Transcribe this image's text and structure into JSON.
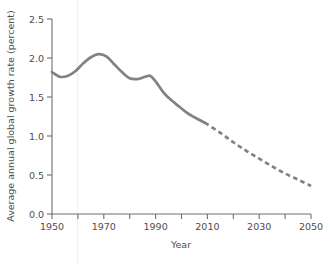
{
  "figure": {
    "width": 330,
    "height": 264,
    "background": "#ffffff",
    "line_color": "#828282",
    "axis_color": "#6e6e6e",
    "text_color": "#4d4d4d"
  },
  "axes": {
    "x_title": "Year",
    "y_title": "Average annual global growth rate (percent)",
    "x_tick_labels": [
      "1950",
      "1970",
      "1990",
      "2010",
      "2030",
      "2050"
    ],
    "x_labeled_ticks": [
      1950,
      1970,
      1990,
      2010,
      2030,
      2050
    ],
    "x_all_ticks": [
      1950,
      1960,
      1970,
      1980,
      1990,
      2000,
      2010,
      2020,
      2030,
      2040,
      2050
    ],
    "y_tick_labels": [
      "0.0",
      "0.5",
      "1.0",
      "1.5",
      "2.0",
      "2.5"
    ],
    "y_ticks": [
      0.0,
      0.5,
      1.0,
      1.5,
      2.0,
      2.5
    ]
  },
  "chart_data": {
    "type": "line",
    "title": "",
    "subtitle": "",
    "xlabel": "Year",
    "ylabel": "Average annual global growth rate (percent)",
    "xlim": [
      1950,
      2050
    ],
    "ylim": [
      0.0,
      2.5
    ],
    "grid": false,
    "legend": "none",
    "annotations": [
      "Solid line: historical estimates (1950-2009)",
      "Dashed line: projection (2009-2050)"
    ],
    "series": [
      {
        "name": "Average annual global growth rate (historical)",
        "style": "solid",
        "color": "#828282",
        "x": [
          1950,
          1953,
          1956,
          1959,
          1962,
          1965,
          1968,
          1971,
          1974,
          1977,
          1980,
          1983,
          1986,
          1988,
          1990,
          1993,
          1996,
          1999,
          2002,
          2005,
          2009
        ],
        "values": [
          1.82,
          1.76,
          1.77,
          1.83,
          1.93,
          2.01,
          2.05,
          2.02,
          1.92,
          1.82,
          1.74,
          1.73,
          1.76,
          1.77,
          1.7,
          1.56,
          1.46,
          1.38,
          1.3,
          1.24,
          1.17
        ]
      },
      {
        "name": "Average annual global growth rate (projected)",
        "style": "dashed",
        "color": "#828282",
        "x": [
          2009,
          2015,
          2020,
          2025,
          2030,
          2035,
          2040,
          2045,
          2050
        ],
        "values": [
          1.17,
          1.04,
          0.92,
          0.81,
          0.71,
          0.61,
          0.52,
          0.44,
          0.36
        ]
      }
    ]
  }
}
